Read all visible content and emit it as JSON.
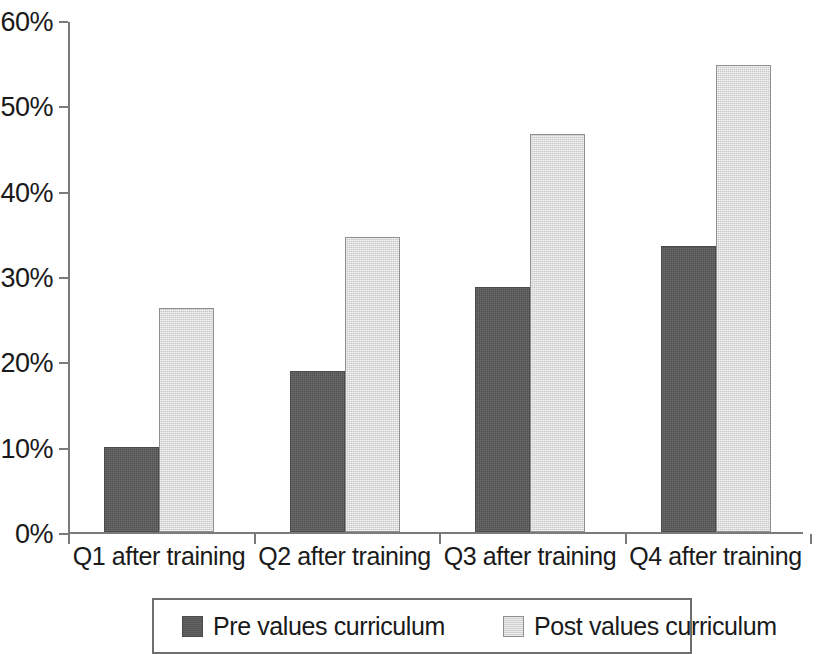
{
  "chart_data": {
    "type": "bar",
    "title": "",
    "subtitle": "",
    "xlabel": "",
    "ylabel": "",
    "categories": [
      "Q1 after training",
      "Q2 after training",
      "Q3 after training",
      "Q4 after training"
    ],
    "series": [
      {
        "name": "Pre values curriculum",
        "color": "#595959",
        "values": [
          10.0,
          18.9,
          28.7,
          33.5
        ]
      },
      {
        "name": "Post values curriculum",
        "color": "#dcdcdc",
        "values": [
          26.3,
          34.6,
          46.7,
          54.7
        ]
      }
    ],
    "ylim": [
      0,
      60
    ],
    "y_ticks": [
      0,
      10,
      20,
      30,
      40,
      50,
      60
    ],
    "y_tick_labels": [
      "0%",
      "10%",
      "20%",
      "30%",
      "40%",
      "50%",
      "60%"
    ],
    "grid": false,
    "legend_position": "bottom",
    "value_format": "percent"
  },
  "legend": {
    "entries": [
      {
        "label": "Pre values curriculum",
        "swatch": "dark-gray-swatch"
      },
      {
        "label": "Post values curriculum",
        "swatch": "light-gray-swatch"
      }
    ]
  }
}
